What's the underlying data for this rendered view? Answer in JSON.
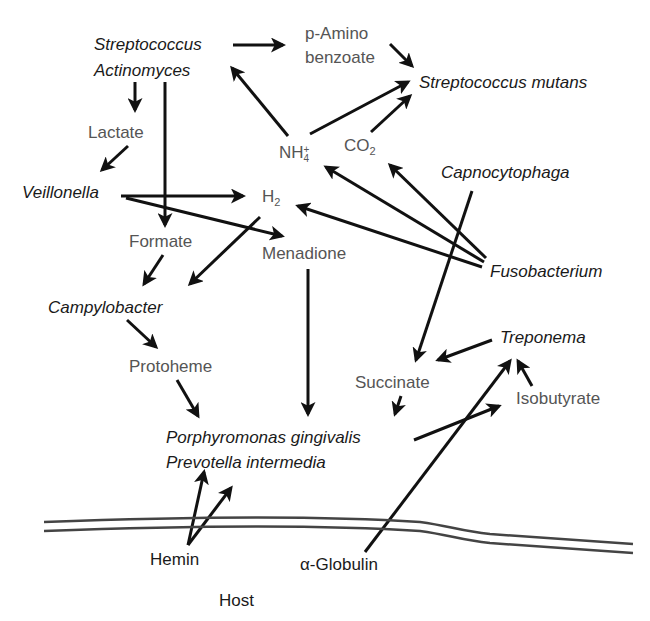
{
  "organisms": {
    "streptococcus": "Streptococcus",
    "actinomyces": "Actinomyces",
    "strep_mutans": "Streptococcus mutans",
    "veillonella": "Veillonella",
    "capnocytophaga": "Capnocytophaga",
    "fusobacterium": "Fusobacterium",
    "campylobacter": "Campylobacter",
    "treponema": "Treponema",
    "p_gingivalis": "Porphyromonas gingivalis",
    "p_intermedia": "Prevotella intermedia"
  },
  "metabolites": {
    "p_amino_1": "p-Amino",
    "p_amino_2": "benzoate",
    "lactate": "Lactate",
    "nh4_base": "NH",
    "nh4_sub": "4",
    "nh4_sup": "+",
    "co2_base": "CO",
    "co2_sub": "2",
    "h2_base": "H",
    "h2_sub": "2",
    "formate": "Formate",
    "menadione": "Menadione",
    "protoheme": "Protoheme",
    "succinate": "Succinate",
    "isobutyrate": "Isobutyrate"
  },
  "host": {
    "hemin": "Hemin",
    "globulin": "α-Globulin",
    "host_label": "Host"
  },
  "colors": {
    "arrow": "#111111",
    "organism_text": "#1a1a1a",
    "metabolite_text": "#555555",
    "membrane": "#444444"
  },
  "edges": [
    {
      "from": "Streptococcus/Actinomyces",
      "to": "p-Aminobenzoate"
    },
    {
      "from": "p-Aminobenzoate",
      "to": "Streptococcus mutans"
    },
    {
      "from": "NH4+",
      "to": "Streptococcus mutans"
    },
    {
      "from": "CO2",
      "to": "Streptococcus mutans"
    },
    {
      "from": "NH4+",
      "to": "Streptococcus/Actinomyces"
    },
    {
      "from": "Streptococcus/Actinomyces",
      "to": "Lactate"
    },
    {
      "from": "Lactate",
      "to": "Veillonella"
    },
    {
      "from": "Streptococcus/Actinomyces",
      "to": "Formate"
    },
    {
      "from": "Veillonella",
      "to": "H2"
    },
    {
      "from": "Veillonella",
      "to": "Menadione"
    },
    {
      "from": "Fusobacterium",
      "to": "H2"
    },
    {
      "from": "Fusobacterium",
      "to": "NH4+"
    },
    {
      "from": "Fusobacterium",
      "to": "CO2"
    },
    {
      "from": "Formate",
      "to": "Campylobacter"
    },
    {
      "from": "H2",
      "to": "Campylobacter"
    },
    {
      "from": "Campylobacter",
      "to": "Protoheme"
    },
    {
      "from": "Protoheme",
      "to": "P. gingivalis/P. intermedia"
    },
    {
      "from": "Menadione",
      "to": "P. gingivalis/P. intermedia"
    },
    {
      "from": "Capnocytophaga",
      "to": "Succinate"
    },
    {
      "from": "Treponema",
      "to": "Succinate"
    },
    {
      "from": "Succinate",
      "to": "P. gingivalis/P. intermedia"
    },
    {
      "from": "P. gingivalis/P. intermedia",
      "to": "Isobutyrate"
    },
    {
      "from": "Isobutyrate",
      "to": "Treponema"
    },
    {
      "from": "α-Globulin",
      "to": "Treponema"
    },
    {
      "from": "Hemin",
      "to": "P. gingivalis/P. intermedia"
    }
  ]
}
